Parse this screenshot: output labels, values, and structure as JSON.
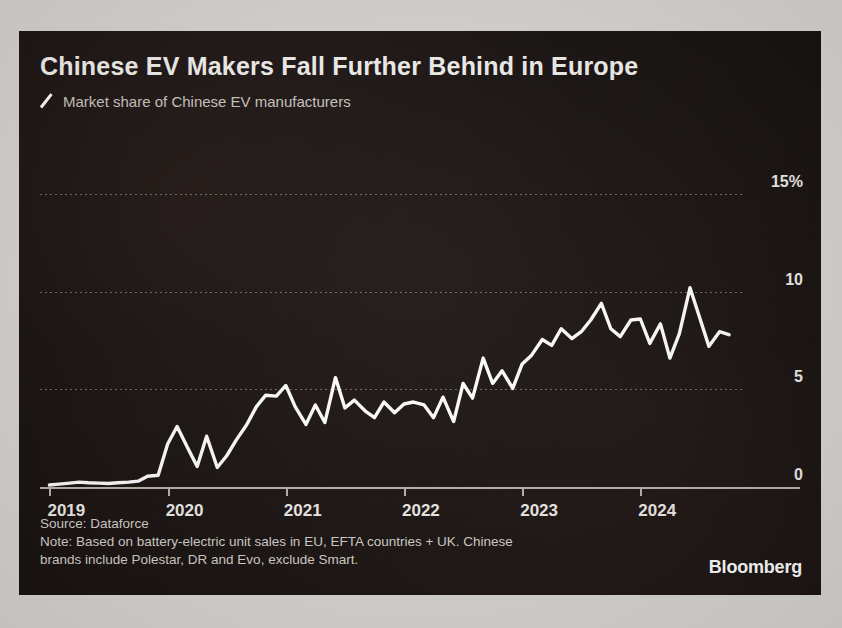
{
  "header": {
    "title": "Chinese EV Makers Fall Further Behind in Europe",
    "subtitle": "Market share of Chinese EV manufacturers",
    "legend_icon": "slash-line-marker"
  },
  "footer": {
    "source": "Source: Dataforce",
    "note_line1": "Note: Based on battery-electric unit sales in EU, EFTA countries + UK. Chinese",
    "note_line2": "brands include Polestar, DR and Evo, exclude Smart.",
    "brand": "Bloomberg"
  },
  "colors": {
    "panel_background": "#14100f",
    "page_background": "#d9d7d3",
    "line": "#ffffff",
    "grid": "#7e7872",
    "axis": "#b9b4ae",
    "title_text": "#f4f2ef",
    "subtitle_text": "#cdc7c1"
  },
  "chart_data": {
    "type": "line",
    "title": "Chinese EV Makers Fall Further Behind in Europe",
    "subtitle": "Market share of Chinese EV manufacturers",
    "xlabel": "",
    "ylabel": "",
    "ylim": [
      -1.2,
      15
    ],
    "xlim": [
      2018.92,
      2024.86
    ],
    "grid": true,
    "legend_position": "top-left",
    "yticks": [
      0,
      5,
      10,
      15
    ],
    "ytick_labels": [
      "0",
      "5",
      "10",
      "15%"
    ],
    "xticks": [
      2019,
      2020,
      2021,
      2022,
      2023,
      2024
    ],
    "xtick_labels": [
      "2019",
      "2020",
      "2021",
      "2022",
      "2023",
      "2024"
    ],
    "series": [
      {
        "name": "Market share of Chinese EV manufacturers",
        "color": "#ffffff",
        "x": [
          2019.0,
          2019.08,
          2019.17,
          2019.25,
          2019.33,
          2019.42,
          2019.5,
          2019.58,
          2019.67,
          2019.75,
          2019.83,
          2019.92,
          2020.0,
          2020.08,
          2020.17,
          2020.25,
          2020.33,
          2020.42,
          2020.5,
          2020.58,
          2020.67,
          2020.75,
          2020.83,
          2020.92,
          2021.0,
          2021.08,
          2021.17,
          2021.25,
          2021.33,
          2021.42,
          2021.5,
          2021.58,
          2021.67,
          2021.75,
          2021.83,
          2021.92,
          2022.0,
          2022.08,
          2022.17,
          2022.25,
          2022.33,
          2022.42,
          2022.5,
          2022.58,
          2022.67,
          2022.75,
          2022.83,
          2022.92,
          2023.0,
          2023.08,
          2023.17,
          2023.25,
          2023.33,
          2023.42,
          2023.5,
          2023.58,
          2023.67,
          2023.75,
          2023.83,
          2023.92,
          2024.0,
          2024.08,
          2024.17,
          2024.25,
          2024.33,
          2024.42,
          2024.5,
          2024.58,
          2024.67,
          2024.75
        ],
        "values": [
          0.1,
          0.15,
          0.2,
          0.25,
          0.22,
          0.2,
          0.18,
          0.22,
          0.25,
          0.3,
          0.55,
          0.6,
          2.2,
          3.1,
          2.0,
          1.05,
          2.6,
          1.0,
          1.6,
          2.4,
          3.2,
          4.1,
          4.7,
          4.65,
          5.2,
          4.1,
          3.2,
          4.2,
          3.3,
          5.6,
          4.05,
          4.45,
          3.9,
          3.55,
          4.35,
          3.8,
          4.25,
          4.35,
          4.2,
          3.55,
          4.6,
          3.35,
          5.3,
          4.55,
          6.6,
          5.3,
          5.95,
          5.05,
          6.3,
          6.75,
          7.55,
          7.25,
          8.1,
          7.6,
          7.95,
          8.55,
          9.4,
          8.1,
          7.7,
          8.55,
          8.6,
          7.35,
          8.35,
          6.6,
          7.85,
          10.2,
          8.7,
          7.2,
          7.95,
          7.8
        ]
      }
    ]
  }
}
